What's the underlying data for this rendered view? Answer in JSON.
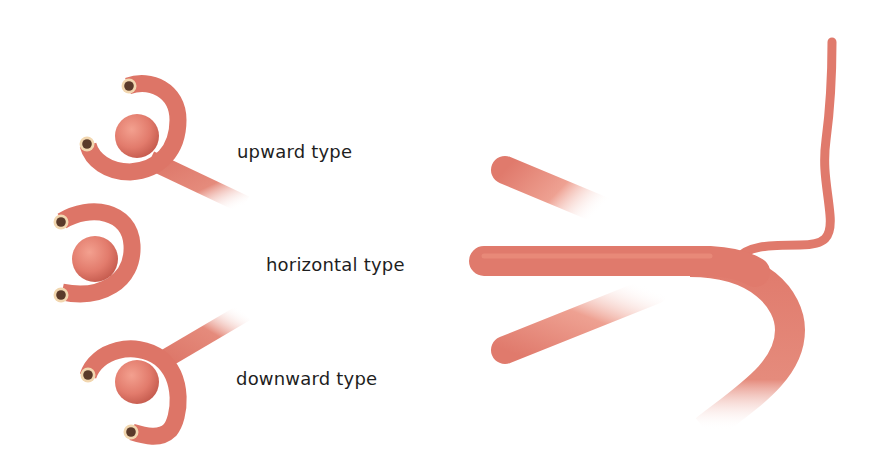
{
  "diagram": {
    "labels": {
      "upward": "upward type",
      "horizontal": "horizontal type",
      "downward": "downward type"
    },
    "left_panel": {
      "variants": [
        "upward",
        "horizontal",
        "downward"
      ],
      "elements": [
        "aneurysm-dome",
        "curved-vessel",
        "parent-artery-stem",
        "vessel-lumen-openings"
      ]
    },
    "right_panel": {
      "elements": [
        "upward-branch-faded",
        "horizontal-main-vessel",
        "downward-branch-faded",
        "curved-descending-vessel",
        "thin-ascending-branch"
      ]
    },
    "colors": {
      "vessel": "#e07a6c",
      "vessel_dark": "#c85a4e",
      "vessel_light": "#f0a594",
      "lumen_ring": "#f2d7b0",
      "lumen_inner": "#5a3a2a",
      "background": "#ffffff",
      "text": "#1e1e1e"
    }
  }
}
